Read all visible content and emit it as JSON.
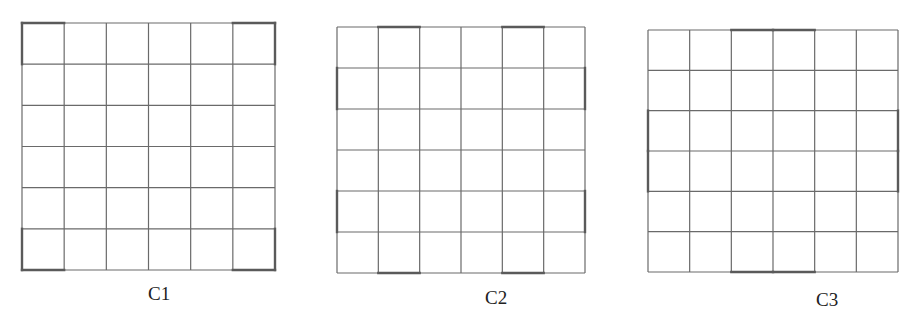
{
  "figure": {
    "grids": [
      {
        "label": "C1",
        "rows": 6,
        "cols": 6,
        "highlighted_cells_description": "four corner cells",
        "thick_edges": {
          "top_cols": [
            1,
            6
          ],
          "bottom_cols": [
            1,
            6
          ],
          "left_rows": [
            1,
            6
          ],
          "right_rows": [
            1,
            6
          ]
        }
      },
      {
        "label": "C2",
        "rows": 6,
        "cols": 6,
        "highlighted_cells_description": "edge cells in columns 2 and 5 (top/bottom) and rows 2 and 5 (left/right)",
        "thick_edges": {
          "top_cols": [
            2,
            5
          ],
          "bottom_cols": [
            2,
            5
          ],
          "left_rows": [
            2,
            5
          ],
          "right_rows": [
            2,
            5
          ]
        }
      },
      {
        "label": "C3",
        "rows": 6,
        "cols": 6,
        "highlighted_cells_description": "middle two cells on each edge",
        "thick_edges": {
          "top_cols": [
            3,
            4
          ],
          "bottom_cols": [
            3,
            4
          ],
          "left_rows": [
            3,
            4
          ],
          "right_rows": [
            3,
            4
          ]
        }
      }
    ]
  }
}
